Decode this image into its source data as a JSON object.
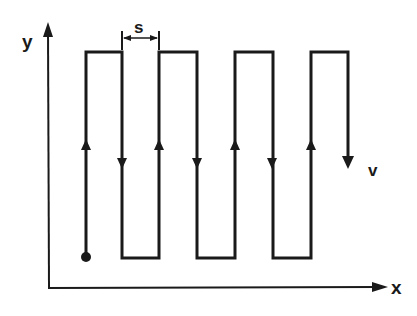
{
  "diagram": {
    "type": "raster-scan-path",
    "colors": {
      "line": "#1a1a1a",
      "background": "#ffffff"
    },
    "axes": {
      "x": {
        "label": "x",
        "origin": [
          49,
          288
        ],
        "end": [
          386,
          288
        ]
      },
      "y": {
        "label": "y",
        "origin": [
          49,
          288
        ],
        "end": [
          47,
          24
        ]
      }
    },
    "labels": {
      "spacing": "s",
      "velocity": "v"
    },
    "path": {
      "start_point": [
        86,
        257
      ],
      "top_y": 52,
      "bottom_y": 258,
      "end_y": 167,
      "columns_x": [
        86,
        122,
        159,
        197,
        235,
        273,
        311,
        348
      ],
      "up_arrow_y": 145,
      "down_arrow_y": 163
    },
    "spacing_marker": {
      "x1": 122,
      "x2": 159,
      "y": 38
    }
  }
}
